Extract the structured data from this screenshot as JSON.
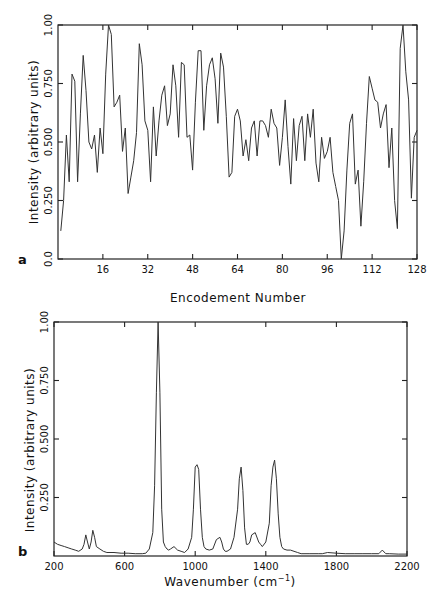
{
  "chart_data": [
    {
      "panel": "a",
      "type": "line",
      "title": "",
      "xlabel": "Encodement Number",
      "ylabel": "Intensity  (arbitrary units)",
      "xlim": [
        0,
        128
      ],
      "ylim": [
        0,
        1.0
      ],
      "xticks": [
        16,
        32,
        48,
        64,
        80,
        96,
        112,
        128
      ],
      "yticks": [
        "0.0",
        "0.250",
        "0.500",
        "0.750",
        "1.00"
      ],
      "grid": false,
      "x": [
        1,
        2,
        3,
        4,
        5,
        6,
        7,
        8,
        9,
        10,
        11,
        12,
        13,
        14,
        15,
        16,
        17,
        18,
        19,
        20,
        21,
        22,
        23,
        24,
        25,
        26,
        27,
        28,
        29,
        30,
        31,
        32,
        33,
        34,
        35,
        36,
        37,
        38,
        39,
        40,
        41,
        42,
        43,
        44,
        45,
        46,
        47,
        48,
        49,
        50,
        51,
        52,
        53,
        54,
        55,
        56,
        57,
        58,
        59,
        60,
        61,
        62,
        63,
        64,
        65,
        66,
        67,
        68,
        69,
        70,
        71,
        72,
        73,
        74,
        75,
        76,
        77,
        78,
        79,
        80,
        81,
        82,
        83,
        84,
        85,
        86,
        87,
        88,
        89,
        90,
        91,
        92,
        93,
        94,
        95,
        96,
        97,
        98,
        99,
        100,
        101,
        102,
        103,
        104,
        105,
        106,
        107,
        108,
        109,
        110,
        111,
        112,
        113,
        114,
        115,
        116,
        117,
        118,
        119,
        120,
        121,
        122,
        123,
        124,
        125,
        126,
        127,
        128
      ],
      "values": [
        0.12,
        0.25,
        0.53,
        0.33,
        0.79,
        0.76,
        0.33,
        0.62,
        0.87,
        0.72,
        0.5,
        0.47,
        0.53,
        0.37,
        0.56,
        0.45,
        0.79,
        1.0,
        0.96,
        0.65,
        0.67,
        0.7,
        0.46,
        0.56,
        0.28,
        0.35,
        0.42,
        0.54,
        0.92,
        0.83,
        0.59,
        0.55,
        0.33,
        0.65,
        0.44,
        0.59,
        0.7,
        0.74,
        0.57,
        0.62,
        0.83,
        0.74,
        0.52,
        0.84,
        0.83,
        0.52,
        0.53,
        0.38,
        0.67,
        0.89,
        0.89,
        0.55,
        0.74,
        0.83,
        0.86,
        0.77,
        0.58,
        0.88,
        0.82,
        0.61,
        0.35,
        0.37,
        0.61,
        0.64,
        0.59,
        0.44,
        0.51,
        0.42,
        0.56,
        0.59,
        0.44,
        0.59,
        0.59,
        0.57,
        0.52,
        0.64,
        0.58,
        0.56,
        0.4,
        0.52,
        0.68,
        0.48,
        0.32,
        0.6,
        0.42,
        0.57,
        0.61,
        0.42,
        0.62,
        0.52,
        0.64,
        0.41,
        0.33,
        0.52,
        0.43,
        0.46,
        0.52,
        0.37,
        0.31,
        0.25,
        0.0,
        0.12,
        0.38,
        0.58,
        0.62,
        0.32,
        0.38,
        0.14,
        0.33,
        0.58,
        0.78,
        0.73,
        0.68,
        0.67,
        0.56,
        0.62,
        0.66,
        0.39,
        0.56,
        0.25,
        0.13,
        0.9,
        1.0,
        0.8,
        0.68,
        0.26,
        0.52,
        0.55
      ]
    },
    {
      "panel": "b",
      "type": "line",
      "title": "",
      "xlabel": "Wavenumber (cm⁻¹)",
      "ylabel": "Intensity  (arbitrary units)",
      "xlim": [
        200,
        2200
      ],
      "ylim": [
        0,
        1.0
      ],
      "xticks": [
        200,
        600,
        1000,
        1400,
        1800,
        2200
      ],
      "yticks": [
        "0.250",
        "0.500",
        "0.750",
        "1.00"
      ],
      "grid": false,
      "x": [
        200,
        220,
        240,
        260,
        280,
        300,
        320,
        340,
        360,
        370,
        380,
        390,
        400,
        410,
        420,
        430,
        440,
        460,
        480,
        500,
        540,
        580,
        620,
        660,
        700,
        720,
        740,
        760,
        770,
        780,
        790,
        800,
        810,
        820,
        830,
        840,
        850,
        860,
        880,
        900,
        920,
        940,
        960,
        980,
        990,
        1000,
        1010,
        1020,
        1030,
        1040,
        1050,
        1060,
        1080,
        1100,
        1120,
        1140,
        1150,
        1160,
        1170,
        1180,
        1200,
        1220,
        1240,
        1250,
        1260,
        1270,
        1280,
        1290,
        1300,
        1310,
        1320,
        1340,
        1360,
        1370,
        1380,
        1400,
        1420,
        1430,
        1440,
        1450,
        1460,
        1470,
        1480,
        1490,
        1500,
        1520,
        1540,
        1560,
        1580,
        1600,
        1650,
        1700,
        1720,
        1750,
        1800,
        1850,
        1900,
        1950,
        2000,
        2040,
        2060,
        2080,
        2100,
        2150,
        2200
      ],
      "values": [
        0.06,
        0.05,
        0.045,
        0.04,
        0.035,
        0.03,
        0.025,
        0.02,
        0.03,
        0.05,
        0.09,
        0.06,
        0.03,
        0.06,
        0.11,
        0.08,
        0.04,
        0.03,
        0.02,
        0.015,
        0.015,
        0.012,
        0.012,
        0.01,
        0.01,
        0.012,
        0.03,
        0.1,
        0.3,
        0.7,
        1.0,
        0.7,
        0.2,
        0.06,
        0.04,
        0.03,
        0.025,
        0.03,
        0.04,
        0.025,
        0.02,
        0.015,
        0.03,
        0.08,
        0.2,
        0.38,
        0.39,
        0.37,
        0.2,
        0.08,
        0.04,
        0.03,
        0.025,
        0.03,
        0.07,
        0.08,
        0.06,
        0.03,
        0.02,
        0.02,
        0.03,
        0.08,
        0.2,
        0.33,
        0.38,
        0.28,
        0.12,
        0.05,
        0.05,
        0.06,
        0.09,
        0.1,
        0.06,
        0.05,
        0.04,
        0.06,
        0.14,
        0.3,
        0.38,
        0.41,
        0.33,
        0.18,
        0.08,
        0.04,
        0.03,
        0.025,
        0.025,
        0.02,
        0.015,
        0.01,
        0.01,
        0.01,
        0.01,
        0.015,
        0.012,
        0.01,
        0.01,
        0.01,
        0.01,
        0.01,
        0.025,
        0.01,
        0.01,
        0.008,
        0.008
      ]
    }
  ],
  "panels": {
    "a": {
      "label": "a",
      "xlabel": "Encodement Number",
      "ylabel": "Intensity  (arbitrary units)",
      "xticks": [
        "16",
        "32",
        "48",
        "64",
        "80",
        "96",
        "112",
        "128"
      ],
      "yticks": [
        "0.0",
        "0.250",
        "0.500",
        "0.750",
        "1.00"
      ]
    },
    "b": {
      "label": "b",
      "xlabel_main": "Wavenumber  (cm",
      "xlabel_sup": "−1",
      "xlabel_end": ")",
      "ylabel": "Intensity  (arbitrary units)",
      "xticks": [
        "200",
        "600",
        "1000",
        "1400",
        "1800",
        "2200"
      ],
      "yticks": [
        "0.250",
        "0.500",
        "0.750",
        "1.00"
      ]
    }
  }
}
